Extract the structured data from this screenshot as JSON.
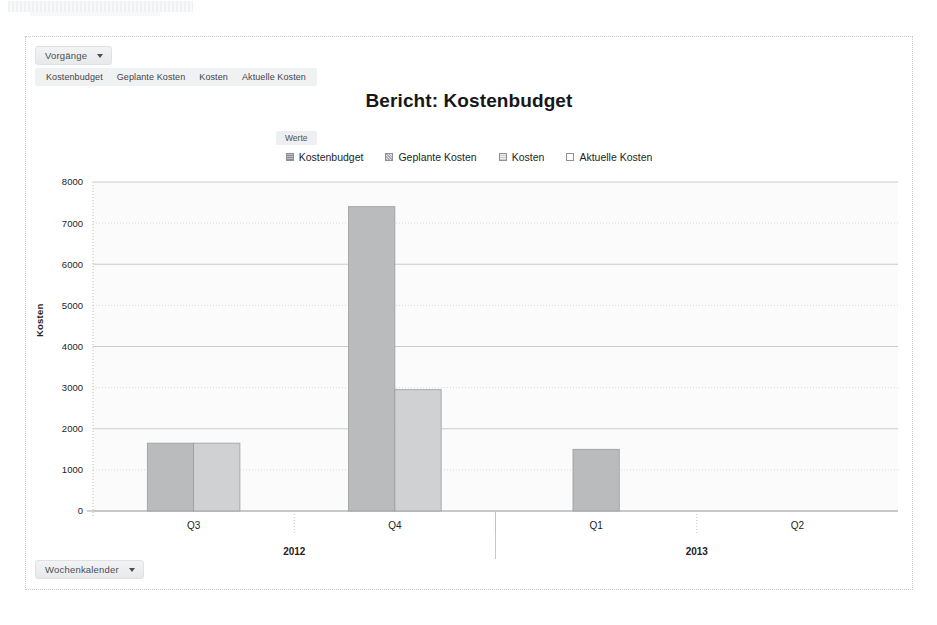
{
  "toolbar": {
    "group_dropdown_label": "Vorgänge",
    "group_dropdown_icon": "chevron-down-icon",
    "measure_tabs": [
      {
        "label": "Kostenbudget"
      },
      {
        "label": "Geplante Kosten"
      },
      {
        "label": "Kosten"
      },
      {
        "label": "Aktuelle Kosten"
      }
    ]
  },
  "footer": {
    "calendar_dropdown_label": "Wochenkalender",
    "calendar_dropdown_icon": "chevron-down-icon"
  },
  "values_chip_label": "Werte",
  "chart_data": {
    "type": "bar",
    "title": "Bericht: Kostenbudget",
    "xlabel": "",
    "ylabel": "Kosten",
    "ylim": [
      0,
      8000
    ],
    "ytick_step": 1000,
    "yticks": [
      "0",
      "1000",
      "2000",
      "3000",
      "4000",
      "5000",
      "6000",
      "7000",
      "8000"
    ],
    "grid": true,
    "legend_position": "top-center",
    "categories": [
      "Q3",
      "Q4",
      "Q1",
      "Q2"
    ],
    "group_labels": [
      "2012",
      "2013"
    ],
    "group_spans": [
      2,
      2
    ],
    "series": [
      {
        "name": "Kostenbudget",
        "color": "#b6b8ba",
        "values": [
          1650,
          7400,
          1500,
          0
        ]
      },
      {
        "name": "Geplante Kosten",
        "color": "#c8cacc",
        "values": [
          1650,
          2950,
          0,
          0
        ]
      },
      {
        "name": "Kosten",
        "color": "#dddfe0",
        "values": [
          0,
          0,
          0,
          0
        ]
      },
      {
        "name": "Aktuelle Kosten",
        "color": "#f3f4f5",
        "values": [
          0,
          0,
          0,
          0
        ]
      }
    ]
  }
}
